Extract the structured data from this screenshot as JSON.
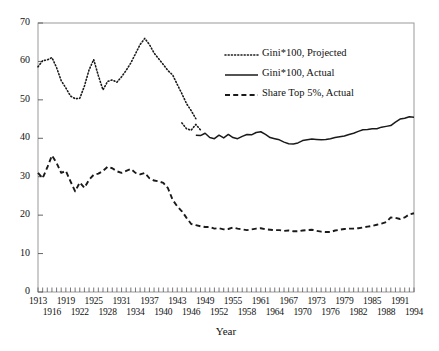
{
  "chart_data": {
    "type": "line",
    "title": "",
    "xlabel": "Year",
    "ylabel": "",
    "xlim": [
      1913,
      1994
    ],
    "ylim": [
      0,
      70
    ],
    "ytick_values": [
      0,
      10,
      20,
      30,
      40,
      50,
      60,
      70
    ],
    "ytick_labels": [
      "0",
      "10",
      "20",
      "30",
      "40",
      "50",
      "60",
      "70"
    ],
    "xtick_step_minor": 1,
    "xtick_labels_row1": [
      "1913",
      "1919",
      "1925",
      "1931",
      "1937",
      "1943",
      "1949",
      "1955",
      "1961",
      "1967",
      "1973",
      "1979",
      "1985",
      "1991"
    ],
    "xtick_labels_row2": [
      "1916",
      "1922",
      "1928",
      "1934",
      "1940",
      "1946",
      "1952",
      "1958",
      "1964",
      "1970",
      "1976",
      "1982",
      "1988",
      "1994"
    ],
    "grid": false,
    "legend_position": "upper right",
    "legend": [
      {
        "label": "Gini*100, Projected",
        "style": "dotted"
      },
      {
        "label": "Gini*100, Actual",
        "style": "solid"
      },
      {
        "label": "Share Top 5%, Actual",
        "style": "dashed"
      }
    ],
    "series": [
      {
        "name": "Gini*100, Projected",
        "style": "dotted",
        "x": [
          1913,
          1914,
          1915,
          1916,
          1917,
          1918,
          1919,
          1920,
          1921,
          1922,
          1923,
          1924,
          1925,
          1926,
          1927,
          1928,
          1929,
          1930,
          1931,
          1932,
          1933,
          1934,
          1935,
          1936,
          1937,
          1938,
          1939,
          1940,
          1941,
          1942,
          1943,
          1944,
          1945,
          1946,
          1947
        ],
        "values": [
          58.6,
          60.2,
          60.4,
          61.0,
          58.4,
          55.0,
          53.1,
          51.0,
          50.3,
          50.4,
          53.6,
          57.8,
          60.5,
          56.3,
          52.6,
          54.8,
          55.2,
          54.6,
          56.0,
          57.7,
          59.6,
          62.0,
          64.4,
          66.0,
          64.4,
          62.2,
          60.7,
          59.2,
          57.6,
          56.5,
          54.0,
          51.6,
          49.0,
          47.2,
          45.1
        ]
      },
      {
        "name": "Gini*100, Projected tail",
        "style": "dotted",
        "x": [
          1944,
          1945,
          1946,
          1947,
          1948
        ],
        "values": [
          44.0,
          42.5,
          42.1,
          43.6,
          42.2
        ]
      },
      {
        "name": "Gini*100, Actual",
        "style": "solid",
        "x": [
          1947,
          1948,
          1949,
          1950,
          1951,
          1952,
          1953,
          1954,
          1955,
          1956,
          1957,
          1958,
          1959,
          1960,
          1961,
          1962,
          1963,
          1964,
          1965,
          1966,
          1967,
          1968,
          1969,
          1970,
          1971,
          1972,
          1973,
          1974,
          1975,
          1976,
          1977,
          1978,
          1979,
          1980,
          1981,
          1982,
          1983,
          1984,
          1985,
          1986,
          1987,
          1988,
          1989,
          1990,
          1991,
          1992,
          1993,
          1994
        ],
        "values": [
          40.8,
          40.7,
          41.3,
          40.2,
          39.9,
          40.8,
          40.1,
          41.0,
          40.2,
          39.9,
          40.5,
          41.0,
          40.9,
          41.5,
          41.7,
          41.0,
          40.2,
          39.9,
          39.6,
          39.0,
          38.6,
          38.5,
          38.8,
          39.4,
          39.6,
          39.8,
          39.7,
          39.6,
          39.7,
          39.9,
          40.2,
          40.4,
          40.6,
          41.0,
          41.3,
          41.8,
          42.2,
          42.3,
          42.5,
          42.5,
          42.9,
          43.1,
          43.3,
          44.2,
          45.0,
          45.2,
          45.6,
          45.5
        ]
      },
      {
        "name": "Share Top 5%, Actual",
        "style": "dashed",
        "x": [
          1913,
          1914,
          1915,
          1916,
          1917,
          1918,
          1919,
          1920,
          1921,
          1922,
          1923,
          1924,
          1925,
          1926,
          1927,
          1928,
          1929,
          1930,
          1931,
          1932,
          1933,
          1934,
          1935,
          1936,
          1937,
          1938,
          1939,
          1940,
          1941,
          1942,
          1943,
          1944,
          1945,
          1946,
          1947,
          1948,
          1949,
          1950,
          1951,
          1952,
          1953,
          1954,
          1955,
          1956,
          1957,
          1958,
          1959,
          1960,
          1961,
          1962,
          1963,
          1964,
          1965,
          1966,
          1967,
          1968,
          1969,
          1970,
          1971,
          1972,
          1973,
          1974,
          1975,
          1976,
          1977,
          1978,
          1979,
          1980,
          1981,
          1982,
          1983,
          1984,
          1985,
          1986,
          1987,
          1988,
          1989,
          1990,
          1991,
          1992,
          1993,
          1994
        ],
        "values": [
          31.0,
          29.6,
          32.4,
          35.5,
          33.6,
          31.0,
          31.5,
          28.8,
          26.2,
          28.5,
          27.1,
          29.2,
          30.5,
          30.8,
          31.5,
          32.6,
          32.2,
          31.4,
          31.0,
          31.5,
          32.0,
          31.0,
          30.6,
          31.0,
          29.6,
          29.0,
          28.8,
          28.4,
          27.0,
          24.0,
          22.3,
          21.0,
          19.3,
          17.7,
          17.4,
          17.1,
          16.9,
          16.9,
          16.5,
          16.6,
          16.3,
          16.4,
          16.8,
          16.5,
          16.3,
          16.1,
          16.3,
          16.5,
          16.6,
          16.3,
          16.2,
          16.1,
          16.1,
          15.9,
          16.0,
          15.8,
          15.8,
          16.0,
          16.1,
          16.2,
          15.9,
          15.7,
          15.6,
          15.6,
          16.0,
          16.2,
          16.4,
          16.5,
          16.5,
          16.6,
          16.8,
          17.0,
          17.2,
          17.5,
          17.8,
          18.2,
          19.4,
          19.3,
          19.0,
          19.4,
          20.2,
          20.5
        ]
      }
    ]
  }
}
